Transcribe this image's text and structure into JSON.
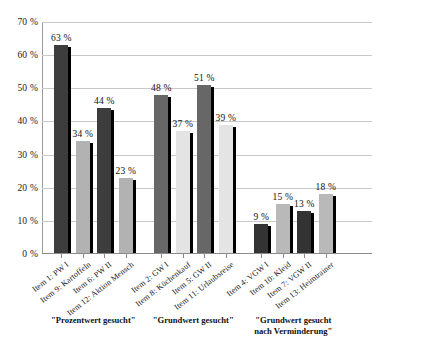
{
  "chart_data": {
    "type": "bar",
    "title": "",
    "subtitle": "",
    "xlabel": "",
    "ylabel": "",
    "ylim": [
      0,
      70
    ],
    "grid": true,
    "legend": "none",
    "y_ticks": [
      "0 %",
      "10 %",
      "20 %",
      "30 %",
      "40 %",
      "50 %",
      "60 %",
      "70 %"
    ],
    "y_tick_values": [
      0,
      10,
      20,
      30,
      40,
      50,
      60,
      70
    ],
    "categories": [
      "Item 1: PW I",
      "Item 9: Kartoffeln",
      "Item 6: PW II",
      "Item 12: Aktion Mensch",
      "Item 2: GW I",
      "Item 8: Küchenkauf",
      "Item 5: GW II",
      "Item 11: Urlaubsreise",
      "Item 4: VGW I",
      "Item 10: Kleid",
      "Item 7: VGW II",
      "Item 13: Heimtrainer"
    ],
    "values": [
      63,
      34,
      44,
      23,
      48,
      37,
      51,
      39,
      9,
      15,
      13,
      18
    ],
    "value_labels": [
      "63 %",
      "34 %",
      "44 %",
      "23 %",
      "48 %",
      "37 %",
      "51 %",
      "39 %",
      "9 %",
      "15 %",
      "13 %",
      "18 %"
    ],
    "bar_colors": [
      "#3d3d3d",
      "#b2b2b2",
      "#3d3d3d",
      "#b2b2b2",
      "#676767",
      "#e4e4e4",
      "#676767",
      "#e4e4e4",
      "#333333",
      "#b9b9b9",
      "#333333",
      "#b9b9b9"
    ],
    "groups": [
      {
        "caption": "\"Prozentwert gesucht\"",
        "start": 0,
        "count": 4
      },
      {
        "caption": "\"Grundwert gesucht\"",
        "start": 4,
        "count": 4
      },
      {
        "caption": "\"Grundwert gesucht\nnach Verminderung\"",
        "start": 8,
        "count": 4
      }
    ],
    "colors": {
      "dark_bar": "#3d3d3d",
      "light_bar": "#b2b2b2",
      "shadow": "#000000",
      "gridline": "#c9c9c9",
      "axis": "#8a8a8a",
      "text": "#111111",
      "background": "#ffffff"
    }
  }
}
